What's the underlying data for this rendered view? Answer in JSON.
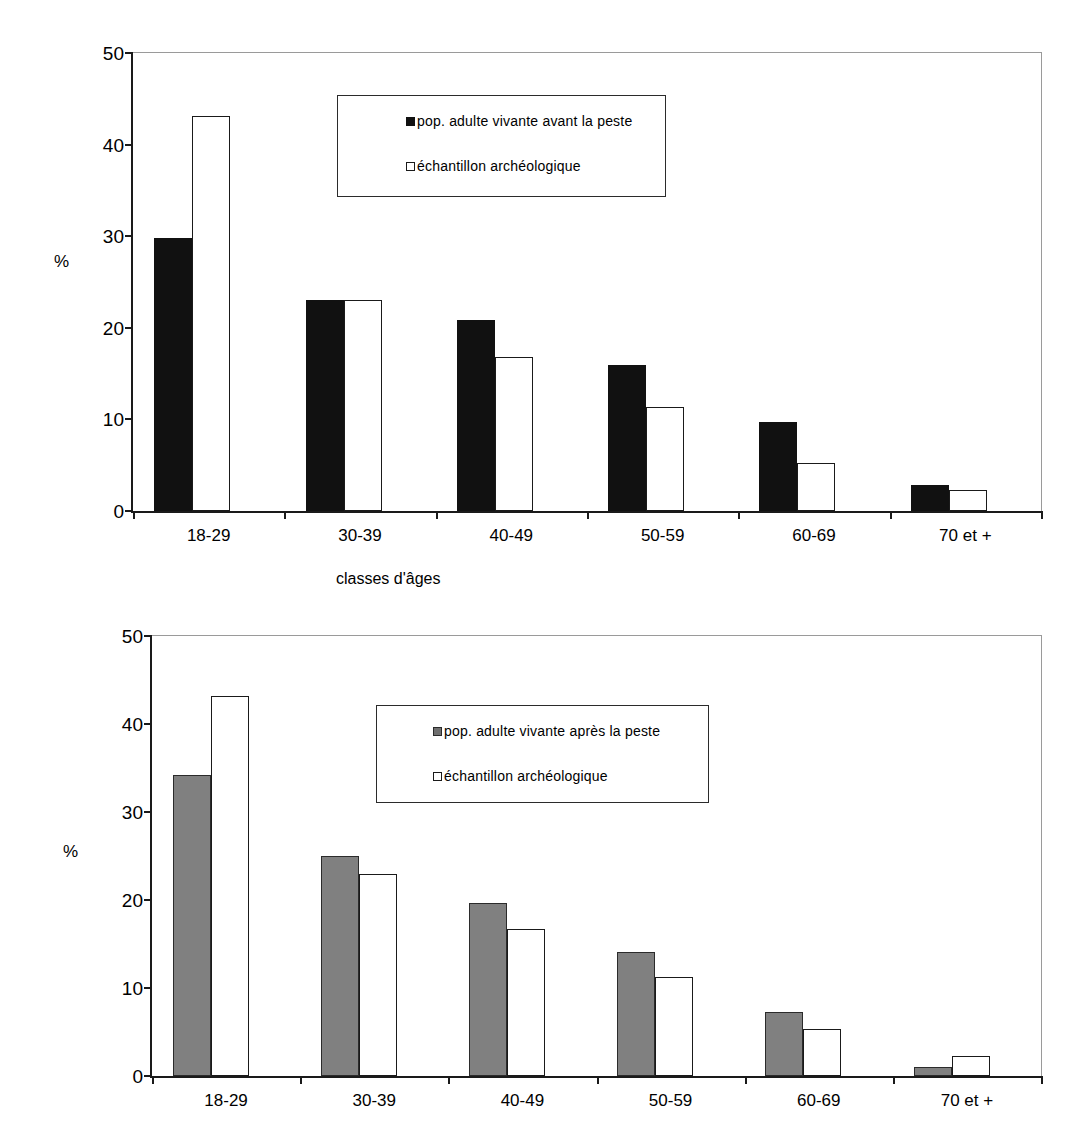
{
  "chart_data": [
    {
      "type": "bar",
      "title": "",
      "xlabel": "classes d'âges",
      "ylabel": "%",
      "ylim": [
        0,
        50
      ],
      "yticks": [
        0,
        10,
        20,
        30,
        40,
        50
      ],
      "grid": false,
      "legend_position": "inside-top-center",
      "categories": [
        "18-29",
        "30-39",
        "40-49",
        "50-59",
        "60-69",
        "70 et +"
      ],
      "series": [
        {
          "name": "pop. adulte vivante avant la peste",
          "swatch": "filled-black",
          "color": "#111111",
          "values": [
            29.8,
            23.0,
            20.8,
            15.9,
            9.7,
            2.8
          ]
        },
        {
          "name": "échantillon archéologique",
          "swatch": "open-white",
          "color": "#ffffff",
          "values": [
            43.1,
            23.0,
            16.8,
            11.4,
            5.2,
            2.3
          ]
        }
      ]
    },
    {
      "type": "bar",
      "title": "",
      "xlabel": "",
      "ylabel": "%",
      "ylim": [
        0,
        50
      ],
      "yticks": [
        0,
        10,
        20,
        30,
        40,
        50
      ],
      "grid": false,
      "legend_position": "inside-top-center",
      "categories": [
        "18-29",
        "30-39",
        "40-49",
        "50-59",
        "60-69",
        "70 et +"
      ],
      "series": [
        {
          "name": "pop. adulte vivante après la peste",
          "swatch": "filled-gray",
          "color": "#808080",
          "values": [
            34.2,
            25.0,
            19.7,
            14.1,
            7.3,
            1.0
          ]
        },
        {
          "name": "échantillon archéologique",
          "swatch": "open-white",
          "color": "#ffffff",
          "values": [
            43.2,
            23.0,
            16.7,
            11.3,
            5.3,
            2.3
          ]
        }
      ]
    }
  ]
}
